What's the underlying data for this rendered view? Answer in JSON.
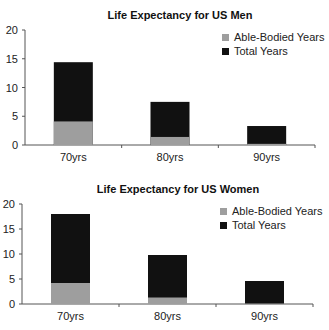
{
  "chart_data": [
    {
      "type": "bar",
      "stacked": true,
      "title": "Life Expectancy for US Men",
      "xlabel": "",
      "ylabel": "",
      "categories": [
        "70yrs",
        "80yrs",
        "90yrs"
      ],
      "series": [
        {
          "name": "Able-Bodied Years",
          "values": [
            4.1,
            1.4,
            0.2
          ],
          "color": "#9e9e9e"
        },
        {
          "name": "Total Years",
          "values": [
            14.4,
            7.5,
            3.3
          ],
          "color": "#111111"
        }
      ],
      "ylim": [
        0,
        20
      ],
      "yticks": [
        0,
        5,
        10,
        15,
        20
      ],
      "legend": "top-right",
      "grid": false
    },
    {
      "type": "bar",
      "stacked": true,
      "title": "Life Expectancy for US Women",
      "xlabel": "",
      "ylabel": "",
      "categories": [
        "70yrs",
        "80yrs",
        "90yrs"
      ],
      "series": [
        {
          "name": "Able-Bodied Years",
          "values": [
            4.2,
            1.3,
            0.1
          ],
          "color": "#9e9e9e"
        },
        {
          "name": "Total Years",
          "values": [
            18.0,
            9.8,
            4.6
          ],
          "color": "#111111"
        }
      ],
      "ylim": [
        0,
        20
      ],
      "yticks": [
        0,
        5,
        10,
        15,
        20
      ],
      "legend": "top-right",
      "grid": false
    }
  ]
}
